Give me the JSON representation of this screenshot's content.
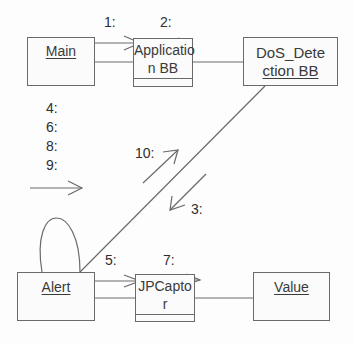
{
  "diagram": {
    "type": "UML collaboration diagram",
    "objects": [
      {
        "id": "main",
        "name": "Main",
        "name_line1": "Main"
      },
      {
        "id": "application",
        "name": "Application BB",
        "name_line1": "Applicatio",
        "name_line2": "n BB"
      },
      {
        "id": "dos",
        "name": "DoS_Detection BB",
        "name_line1": "DoS_Dete",
        "name_line2": "ction BB"
      },
      {
        "id": "alert",
        "name": "Alert",
        "name_line1": "Alert"
      },
      {
        "id": "jpcaptor",
        "name": "JPCaptor",
        "name_line1": "JPCapto",
        "name_line2": "r"
      },
      {
        "id": "value",
        "name": "Value",
        "name_line1": "Value"
      }
    ],
    "links": [
      {
        "from": "Main",
        "to": "Application BB"
      },
      {
        "from": "Application BB",
        "to": "DoS_Detection BB"
      },
      {
        "from": "DoS_Detection BB",
        "to": "Alert"
      },
      {
        "from": "Alert",
        "to": "Alert",
        "kind": "self-link"
      },
      {
        "from": "Alert",
        "to": "JPCaptor"
      },
      {
        "from": "JPCaptor",
        "to": "Value"
      }
    ],
    "messages": {
      "m1": "1:",
      "m2": "2:",
      "m3": "3:",
      "m4": "4:",
      "m5": "5:",
      "m6": "6:",
      "m7": "7:",
      "m8": "8:",
      "m9": "9:",
      "m10": "10:"
    },
    "colors": {
      "line": "#6a6a6a",
      "text": "#3a3a3a",
      "background": "#fdfdfd"
    }
  }
}
